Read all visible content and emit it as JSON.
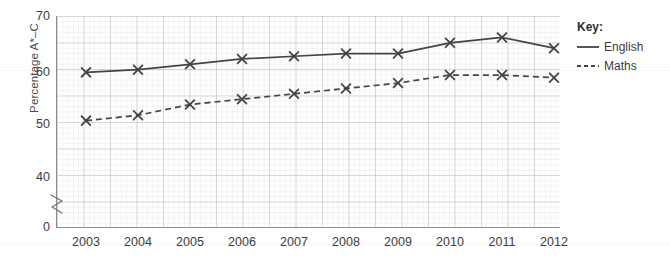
{
  "chart_data": {
    "type": "line",
    "title": "",
    "xlabel": "",
    "ylabel": "Percentage A*–C",
    "categories": [
      "2003",
      "2004",
      "2005",
      "2006",
      "2007",
      "2008",
      "2009",
      "2010",
      "2011",
      "2012"
    ],
    "x": [
      2003,
      2004,
      2005,
      2006,
      2007,
      2008,
      2009,
      2010,
      2011,
      2012
    ],
    "series": [
      {
        "name": "English",
        "style": "solid",
        "marker": "x",
        "color": "#444444",
        "values": [
          59.5,
          60,
          61,
          62,
          62.5,
          63,
          63,
          65,
          66,
          64
        ]
      },
      {
        "name": "Maths",
        "style": "dashed",
        "marker": "x",
        "color": "#444444",
        "values": [
          50.5,
          51.5,
          53.5,
          54.5,
          55.5,
          56.5,
          57.5,
          59,
          59,
          58.5
        ]
      }
    ],
    "ylim": [
      0,
      70
    ],
    "y_ticks": [
      "0",
      "40",
      "50",
      "60",
      "70"
    ],
    "y_axis_break": true,
    "y_axis_break_between": [
      0,
      40
    ],
    "grid": true,
    "grid_minor": true,
    "legend_position": "right"
  },
  "legend": {
    "title": "Key:",
    "entries": [
      {
        "label": "English",
        "style": "solid"
      },
      {
        "label": "Maths",
        "style": "dashed"
      }
    ]
  },
  "axes": {
    "y_title": "Percentage A*–C",
    "y_ticks": [
      {
        "value": "70",
        "y": 16
      },
      {
        "value": "60",
        "y": 71.5
      },
      {
        "value": "50",
        "y": 124
      },
      {
        "value": "40",
        "y": 177
      },
      {
        "value": "0",
        "y": 227
      }
    ],
    "x_ticks": [
      "2003",
      "2004",
      "2005",
      "2006",
      "2007",
      "2008",
      "2009",
      "2010",
      "2011",
      "2012"
    ]
  },
  "colors": {
    "line": "#444444",
    "axis": "#8d8d8d",
    "grid_major": "#b9b9b9",
    "grid_minor": "#dcdcdc",
    "text": "#3c3c3c",
    "background": "#ffffff"
  }
}
